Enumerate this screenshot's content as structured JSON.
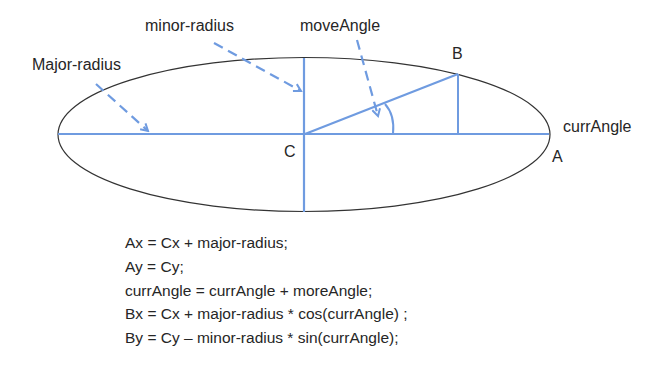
{
  "diagram": {
    "colors": {
      "accent": "#6f9be0",
      "ellipse": "#333333",
      "text": "#262626"
    },
    "labels": {
      "minor_radius": "minor-radius",
      "move_angle": "moveAngle",
      "major_radius": "Major-radius",
      "point_b": "B",
      "curr_angle": "currAngle",
      "point_c": "C",
      "point_a": "A"
    },
    "ellipse": {
      "cx": 304,
      "cy": 134.5,
      "rx": 246,
      "ry": 77
    }
  },
  "formulas": [
    "Ax = Cx + major-radius;",
    "Ay = Cy;",
    "currAngle = currAngle + moreAngle;",
    "Bx = Cx + major-radius * cos(currAngle) ;",
    "By = Cy – minor-radius * sin(currAngle);"
  ]
}
